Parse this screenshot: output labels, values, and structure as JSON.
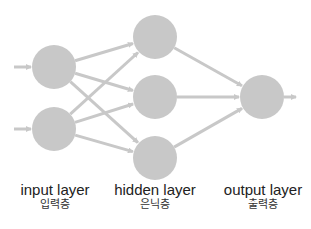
{
  "colors": {
    "node": "#c8c8c8",
    "edge": "#c8c8c8",
    "text": "#222222",
    "background": "#ffffff"
  },
  "layers": [
    {
      "id": "input",
      "label": "input layer",
      "label_ko": "입력층",
      "node_count": 2
    },
    {
      "id": "hidden",
      "label": "hidden layer",
      "label_ko": "은닉층",
      "node_count": 3
    },
    {
      "id": "output",
      "label": "output layer",
      "label_ko": "출력층",
      "node_count": 1
    }
  ],
  "nodes": [
    {
      "id": "i1",
      "layer": "input",
      "cx": 54,
      "cy": 67,
      "r": 22
    },
    {
      "id": "i2",
      "layer": "input",
      "cx": 54,
      "cy": 129,
      "r": 22
    },
    {
      "id": "h1",
      "layer": "hidden",
      "cx": 155,
      "cy": 37,
      "r": 22
    },
    {
      "id": "h2",
      "layer": "hidden",
      "cx": 155,
      "cy": 97,
      "r": 22
    },
    {
      "id": "h3",
      "layer": "hidden",
      "cx": 155,
      "cy": 158,
      "r": 22
    },
    {
      "id": "o1",
      "layer": "output",
      "cx": 262,
      "cy": 97,
      "r": 22
    }
  ],
  "edges": [
    {
      "from": "in_arrow_1",
      "to": "i1"
    },
    {
      "from": "in_arrow_2",
      "to": "i2"
    },
    {
      "from": "i1",
      "to": "h1"
    },
    {
      "from": "i1",
      "to": "h2"
    },
    {
      "from": "i1",
      "to": "h3"
    },
    {
      "from": "i2",
      "to": "h1"
    },
    {
      "from": "i2",
      "to": "h2"
    },
    {
      "from": "i2",
      "to": "h3"
    },
    {
      "from": "h1",
      "to": "o1"
    },
    {
      "from": "h2",
      "to": "o1"
    },
    {
      "from": "h3",
      "to": "o1"
    },
    {
      "from": "o1",
      "to": "out_arrow"
    }
  ]
}
